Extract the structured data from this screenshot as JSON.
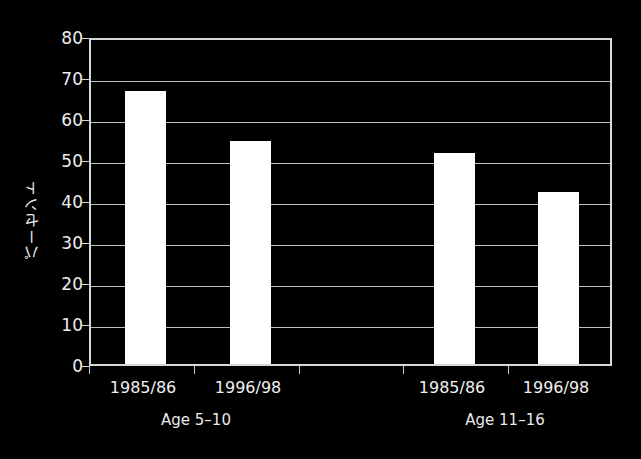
{
  "chart_data": {
    "type": "bar",
    "title": "",
    "subtitle": "",
    "xlabel": "",
    "ylabel": "パーセント",
    "ylim": [
      0,
      80
    ],
    "ytick_values": [
      0,
      10,
      20,
      30,
      40,
      50,
      60,
      70,
      80
    ],
    "ytick_labels": [
      "0",
      "10",
      "20",
      "30",
      "40",
      "50",
      "60",
      "70",
      "80"
    ],
    "grid": true,
    "grid_axis": "y",
    "legend": "none",
    "bar_color": "#ffffff",
    "background_color": "#000000",
    "axis_color": "#d8d8d8",
    "categories": [
      "1985/86",
      "1996/98",
      "1985/86",
      "1996/98"
    ],
    "values": [
      67.5,
      55.0,
      52.0,
      42.5
    ],
    "groups": [
      {
        "label": "Age 5–10",
        "bars": [
          {
            "category": "1985/86",
            "value": 67.5
          },
          {
            "category": "1996/98",
            "value": 55.0
          }
        ]
      },
      {
        "label": "Age 11–16",
        "bars": [
          {
            "category": "1985/86",
            "value": 52.0
          },
          {
            "category": "1996/98",
            "value": 42.5
          }
        ]
      }
    ],
    "bar_geometry": [
      {
        "left": 123,
        "width": 41,
        "value": 67.5
      },
      {
        "left": 228,
        "width": 41,
        "value": 55.0
      },
      {
        "left": 432,
        "width": 41,
        "value": 52.0
      },
      {
        "left": 536,
        "width": 41,
        "value": 42.5
      }
    ],
    "xtick_positions": [
      89,
      194,
      299,
      403,
      508,
      612
    ],
    "xtick_label_positions": [
      143,
      248,
      452,
      556
    ],
    "group_label_positions": [
      196,
      505
    ]
  }
}
